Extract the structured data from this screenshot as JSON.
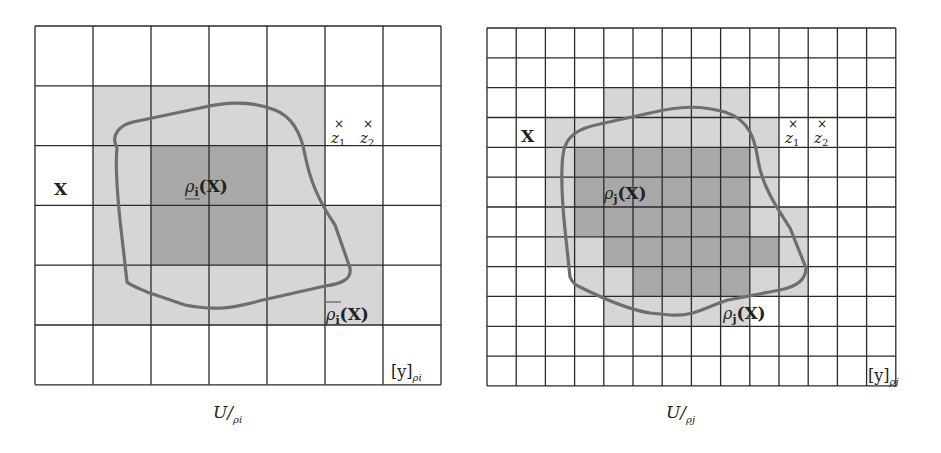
{
  "colors": {
    "grid_line": "#2a2a2a",
    "upper_fill": "#d6d6d6",
    "lower_fill": "#a8a8a8",
    "curve": "#6e6e6e",
    "background": "#ffffff"
  },
  "panels": [
    {
      "id": "left",
      "grid": {
        "x": 35,
        "y": 26,
        "cols": 7,
        "rows": 6,
        "cell_w": 58,
        "cell_h": 59.8
      },
      "upper_cells": [
        [
          1,
          1
        ],
        [
          1,
          2
        ],
        [
          1,
          3
        ],
        [
          1,
          4
        ],
        [
          2,
          1
        ],
        [
          2,
          4
        ],
        [
          3,
          1
        ],
        [
          3,
          4
        ],
        [
          3,
          5
        ],
        [
          4,
          1
        ],
        [
          4,
          2
        ],
        [
          4,
          3
        ],
        [
          4,
          4
        ],
        [
          4,
          5
        ]
      ],
      "lower_cells": [
        [
          2,
          2
        ],
        [
          2,
          3
        ],
        [
          3,
          2
        ],
        [
          3,
          3
        ]
      ],
      "labels": {
        "set": "X",
        "lower": "ρi(X)",
        "lower_rho": "ρ",
        "lower_sub": "i",
        "lower_arg": "(X)",
        "upper": "ρi(X)",
        "upper_rho": "ρ",
        "upper_sub": "i",
        "upper_arg": "(X)",
        "z1": "z",
        "z1_sub": "1",
        "z2": "z",
        "z2_sub": "2",
        "mark": "×",
        "class_label": "[y]",
        "class_sub": "ρi",
        "caption_main": "U/",
        "caption_sub": "ρi"
      }
    },
    {
      "id": "right",
      "grid": {
        "x": 487,
        "y": 28,
        "cols": 14,
        "rows": 12,
        "cell_w": 29.2,
        "cell_h": 29.83
      },
      "upper_cells": [
        [
          2,
          4
        ],
        [
          2,
          5
        ],
        [
          2,
          6
        ],
        [
          2,
          7
        ],
        [
          2,
          8
        ],
        [
          3,
          2
        ],
        [
          3,
          3
        ],
        [
          3,
          4
        ],
        [
          3,
          5
        ],
        [
          3,
          6
        ],
        [
          3,
          7
        ],
        [
          3,
          8
        ],
        [
          3,
          9
        ],
        [
          4,
          2
        ],
        [
          4,
          9
        ],
        [
          5,
          2
        ],
        [
          5,
          9
        ],
        [
          6,
          2
        ],
        [
          6,
          9
        ],
        [
          6,
          10
        ],
        [
          7,
          2
        ],
        [
          7,
          3
        ],
        [
          7,
          10
        ],
        [
          8,
          3
        ],
        [
          8,
          4
        ],
        [
          8,
          9
        ],
        [
          8,
          10
        ],
        [
          9,
          4
        ],
        [
          9,
          5
        ],
        [
          9,
          6
        ],
        [
          9,
          7
        ],
        [
          9,
          8
        ]
      ],
      "lower_cells": [
        [
          4,
          3
        ],
        [
          4,
          4
        ],
        [
          4,
          5
        ],
        [
          4,
          6
        ],
        [
          4,
          7
        ],
        [
          4,
          8
        ],
        [
          5,
          3
        ],
        [
          5,
          4
        ],
        [
          5,
          5
        ],
        [
          5,
          6
        ],
        [
          5,
          7
        ],
        [
          5,
          8
        ],
        [
          6,
          3
        ],
        [
          6,
          4
        ],
        [
          6,
          5
        ],
        [
          6,
          6
        ],
        [
          6,
          7
        ],
        [
          6,
          8
        ],
        [
          7,
          4
        ],
        [
          7,
          5
        ],
        [
          7,
          6
        ],
        [
          7,
          7
        ],
        [
          7,
          8
        ],
        [
          7,
          9
        ],
        [
          8,
          5
        ],
        [
          8,
          6
        ],
        [
          8,
          7
        ],
        [
          8,
          8
        ]
      ],
      "labels": {
        "set": "X",
        "lower": "ρj(X)",
        "lower_rho": "ρ",
        "lower_sub": "j",
        "lower_arg": "(X)",
        "upper": "ρj(X)",
        "upper_rho": "ρ",
        "upper_sub": "j",
        "upper_arg": "(X)",
        "z1": "z",
        "z1_sub": "1",
        "z2": "z",
        "z2_sub": "2",
        "mark": "×",
        "class_label": "[y]",
        "class_sub": "ρj",
        "caption_main": "U/",
        "caption_sub": "ρj"
      }
    }
  ]
}
